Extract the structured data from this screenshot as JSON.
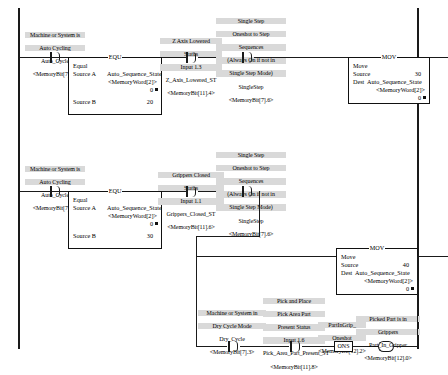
{
  "diagram": {
    "accent_label_bg": "#d9d9d9",
    "line_color": "#1a1a1a"
  },
  "rung1": {
    "contact_auto_cycle": {
      "desc_line1": "Machine or System is",
      "desc_line2": "Auto Cycling",
      "tag": "Auto_Cycle",
      "address": "<MemoryBit[7].0>",
      "type": "XIC"
    },
    "equ": {
      "header": "Auto Sequence State",
      "mnemonic": "EQU",
      "op_name": "Equal",
      "source_a_label": "Source A",
      "source_a_tag": "Auto_Sequence_State",
      "source_a_address": "<MemoryWord[2]>",
      "source_a_value": "0",
      "source_b_label": "Source B",
      "source_b_value": "20"
    },
    "contact_z_axis": {
      "desc_line1": "Z Axis Lowered",
      "desc_line2": "Status",
      "desc_line3": "Input 1.3",
      "tag": "Z_Axis_Lowered_ST",
      "address": "<MemoryBit[11].4>",
      "type": "XIC"
    },
    "contact_single_step": {
      "desc_line1": "Single Step",
      "desc_line2": "Oneshot to Step",
      "desc_line3": "Sequences",
      "desc_line4": "(Always On if not in",
      "desc_line5": "Single Step Mode)",
      "tag": "SingleStep",
      "address": "<MemoryBit[7].6>",
      "type": "XIC"
    },
    "mov": {
      "header": "Auto Sequence State",
      "mnemonic": "MOV",
      "op_name": "Move",
      "source_label": "Source",
      "source_value": "30",
      "dest_label": "Dest",
      "dest_tag": "Auto_Sequence_State",
      "dest_address": "<MemoryWord[2]>",
      "dest_value": "0"
    }
  },
  "rung2": {
    "contact_auto_cycle": {
      "desc_line1": "Machine or System is",
      "desc_line2": "Auto Cycling",
      "tag": "Auto_Cycle",
      "address": "<MemoryBit[7].0>",
      "type": "XIC"
    },
    "equ": {
      "header": "Auto Sequence State",
      "mnemonic": "EQU",
      "op_name": "Equal",
      "source_a_label": "Source A",
      "source_a_tag": "Auto_Sequence_State",
      "source_a_address": "<MemoryWord[2]>",
      "source_a_value": "0",
      "source_b_label": "Source B",
      "source_b_value": "30"
    },
    "contact_grippers": {
      "desc_line1": "Grippers Closed",
      "desc_line2": "Status",
      "desc_line3": "Input 1.1",
      "tag": "Grippers_Closed_ST",
      "address": "<MemoryBit[11].6>",
      "type": "XIC"
    },
    "contact_single_step": {
      "desc_line1": "Single Step",
      "desc_line2": "Oneshot to Step",
      "desc_line3": "Sequences",
      "desc_line4": "(Always On if not in",
      "desc_line5": "Single Step Mode)",
      "tag": "SingleStep",
      "address": "<MemoryBit[7].6>",
      "type": "XIC"
    },
    "mov": {
      "header": "Auto Sequence State",
      "mnemonic": "MOV",
      "op_name": "Move",
      "source_label": "Source",
      "source_value": "40",
      "dest_label": "Dest",
      "dest_tag": "Auto_Sequence_State",
      "dest_address": "<MemoryWord[2]>",
      "dest_value": "0"
    },
    "branch": {
      "contact_dry_cycle": {
        "desc_line1": "Machine or System in",
        "desc_line2": "Dry Cycle Mode",
        "tag": "Dry_Cycle",
        "address": "<MemoryBit[7].3>",
        "type": "XIC"
      },
      "contact_pick_area": {
        "desc_line1": "Pick and Place",
        "desc_line2": "Pick Area Part",
        "desc_line3": "Present Status",
        "desc_line4": "Input 1.6",
        "tag": "Pick_Area_Part_Present_ST",
        "address": "<MemoryBit[11].8>",
        "type": "XIC"
      },
      "ons": {
        "desc_line1": "PartInGrip_",
        "desc_line2": "Oneshot",
        "address": "<MemoryBit[12].2>",
        "mnemonic": "ONS"
      },
      "coil_part_in_gripper": {
        "desc_line1": "Picked Part is in",
        "desc_line2": "Grippers",
        "tag": "Part_In_Gripper",
        "address": "<MemoryBit[12].0>",
        "type": "OTE"
      }
    }
  }
}
